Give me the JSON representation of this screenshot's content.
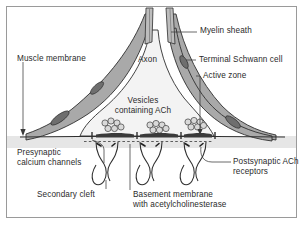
{
  "figure": {
    "border_color": "#9a9a9a",
    "background": "#ffffff"
  },
  "colors": {
    "schwann_fill": "#a9a9a9",
    "schwann_stroke": "#2f2f2f",
    "nucleus_fill": "#6e6e6e",
    "terminal_fill": "#f2f2f2",
    "muscle_fill": "#e3e3e3",
    "active_zone_fill": "#3a3a3a",
    "vesicle_fill": "#d8d8d8",
    "vesicle_stroke": "#444444",
    "text": "#2b2b2b",
    "leader": "#3a3a3a"
  },
  "labels": {
    "myelin_sheath": "Myelin sheath",
    "terminal_schwann_cell": "Terminal Schwann cell",
    "active_zone": "Active zone",
    "axon": "Axon",
    "muscle_membrane": "Muscle membrane",
    "vesicles_line1": "Vesicles",
    "vesicles_line2": "containing ACh",
    "presynaptic_line1": "Presynaptic",
    "presynaptic_line2": "calcium channels",
    "postsynaptic_line1": "Postsynaptic ACh",
    "postsynaptic_line2": "receptors",
    "secondary_cleft": "Secondary cleft",
    "basement_line1": "Basement membrane",
    "basement_line2": "with acetylcholinesterase"
  },
  "structure": {
    "vesicle_clusters": 3,
    "active_zones": 3,
    "junctional_folds": 3,
    "schwann_nuclei": 4
  }
}
